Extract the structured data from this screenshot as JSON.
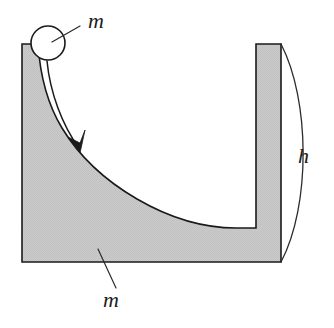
{
  "figure": {
    "canvas": {
      "width": 334,
      "height": 328
    },
    "background_color": "#ffffff"
  },
  "colors": {
    "block_fill": "#c9c9c9",
    "block_stroke": "#1a1a1a",
    "ball_fill": "#ffffff",
    "ball_stroke": "#1a1a1a",
    "leader_line": "#2b2b2b",
    "arrow": "#1a1a1a",
    "height_arc": "#2b2b2b",
    "label_text": "#1a1a1a"
  },
  "block": {
    "name": "curved block",
    "outer_left_x": 22,
    "outer_bottom_y": 262,
    "outer_right_x": 281,
    "left_wall_top_y": 44,
    "left_wall_inner_top_x": 38,
    "right_post_top_y": 44,
    "right_post_inner_x": 256,
    "bowl_bottom_y": 228,
    "fill": "#c9c9c9",
    "path": "M 22 44 L 22 262 L 281 262 L 281 44 L 256 44 L 256 228 L 236 228 C 170 228 96 184 62 128 C 48 105 40 74 38 44 Z"
  },
  "ball": {
    "name": "ball",
    "center_x": 48,
    "center_y": 43,
    "radius": 17,
    "fill": "#ffffff",
    "stroke": "#1a1a1a"
  },
  "motion_arrow": {
    "name": "motion arrow",
    "path": "M 47 61 C 50 92 62 125 79 148",
    "tip_x": 80,
    "tip_y": 152,
    "head_path": "M 80 153 L 68 137 L 80 143 L 85 130 Z"
  },
  "height_arc": {
    "name": "height arc",
    "path": "M 281 44 C 310 100 311 205 281 262",
    "top_x": 281,
    "top_y": 44,
    "bottom_x": 281,
    "bottom_y": 262
  },
  "labels": {
    "ball_mass": {
      "text": "m",
      "x": 88,
      "y": 28,
      "font_size": 22,
      "leader_path": "M 52 42 L 80 26"
    },
    "block_mass": {
      "text": "m",
      "x": 103,
      "y": 307,
      "font_size": 22,
      "leader_path": "M 98 249 L 116 288"
    },
    "height": {
      "text": "h",
      "x": 298,
      "y": 163,
      "font_size": 22
    }
  }
}
